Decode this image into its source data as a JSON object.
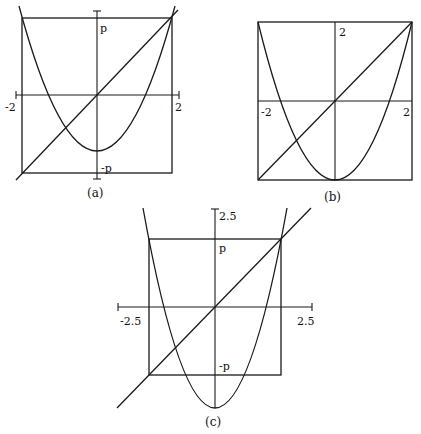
{
  "figure": {
    "panels": [
      {
        "id": "a",
        "caption": "(a)",
        "labels": {
          "x_min": "-2",
          "x_max": "2",
          "y_top": "p",
          "y_bottom": "-p"
        },
        "description": "Square [-2,2]x[-p,p] with parabola and diagonal line y=x through origin"
      },
      {
        "id": "b",
        "caption": "(b)",
        "labels": {
          "x_min": "-2",
          "x_max": "2",
          "y_top": "2"
        },
        "description": "Square [-2,2]x[-2,2] with parabola vertex at bottom edge and diagonal"
      },
      {
        "id": "c",
        "caption": "(c)",
        "labels": {
          "x_min": "-2.5",
          "x_max": "2.5",
          "y_top_axis": "2.5",
          "y_top": "p",
          "y_bottom": "-p"
        },
        "description": "Square [-p,p]^2 inside axes [-2.5,2.5] with parabola vertex below square and diagonal"
      }
    ]
  },
  "colors": {
    "stroke": "#1a1a1a",
    "background": "#ffffff"
  }
}
